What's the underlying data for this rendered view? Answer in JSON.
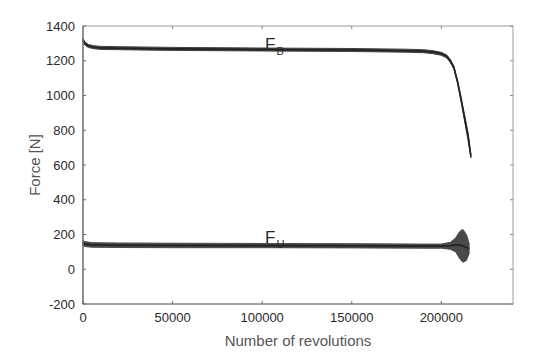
{
  "chart_data": {
    "type": "line",
    "title": "",
    "xlabel": "Number of revolutions",
    "ylabel": "Force [N]",
    "xlim": [
      0,
      240000
    ],
    "ylim": [
      -200,
      1400
    ],
    "xticks": [
      0,
      50000,
      100000,
      150000,
      200000
    ],
    "xtick_labels": [
      "0",
      "50000",
      "100000",
      "150000",
      "200000"
    ],
    "yticks": [
      -200,
      0,
      200,
      400,
      600,
      800,
      1000,
      1200,
      1400
    ],
    "ytick_labels": [
      "-200",
      "0",
      "200",
      "400",
      "600",
      "800",
      "1000",
      "1200",
      "1400"
    ],
    "grid": false,
    "legend": null,
    "annotations": [
      {
        "text": "F",
        "subscript": "B",
        "x": 110000,
        "y": 1310
      },
      {
        "text": "F",
        "subscript": "U",
        "x": 110000,
        "y": 200
      }
    ],
    "series": [
      {
        "name": "F_B",
        "color": "#333333",
        "x": [
          0,
          1000,
          3000,
          6000,
          10000,
          20000,
          50000,
          100000,
          150000,
          180000,
          190000,
          195000,
          200000,
          203000,
          205000,
          207000,
          209000,
          211000,
          213000,
          215000,
          216500
        ],
        "y": [
          1320,
          1300,
          1285,
          1278,
          1274,
          1272,
          1268,
          1265,
          1262,
          1258,
          1255,
          1250,
          1240,
          1225,
          1200,
          1160,
          1080,
          980,
          870,
          760,
          650
        ],
        "band_width": [
          12,
          10,
          8,
          8,
          8,
          8,
          8,
          8,
          8,
          8,
          8,
          8,
          8,
          9,
          10,
          12,
          16,
          24,
          34,
          44,
          10
        ]
      },
      {
        "name": "F_U",
        "color": "#3a3a3a",
        "x": [
          0,
          1000,
          5000,
          20000,
          50000,
          100000,
          150000,
          190000,
          200000,
          205000,
          208000,
          210000,
          212000,
          214000,
          215500
        ],
        "y": [
          150,
          145,
          140,
          138,
          137,
          136,
          135,
          133,
          133,
          135,
          140,
          140,
          135,
          125,
          120
        ],
        "band_width": [
          30,
          28,
          26,
          26,
          26,
          24,
          24,
          24,
          24,
          40,
          80,
          150,
          190,
          150,
          60
        ]
      }
    ]
  }
}
